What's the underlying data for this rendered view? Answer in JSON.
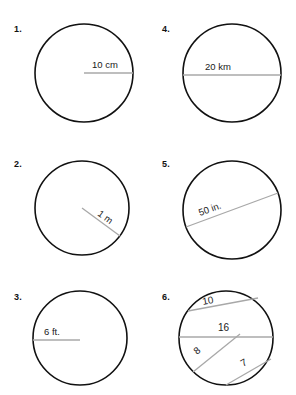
{
  "worksheet": {
    "title": "Circle radius and diameter worksheet",
    "problems": [
      {
        "number": "1.",
        "figure": "circle-with-radius",
        "label": "10 cm",
        "line_type": "radius",
        "direction": "center-to-right"
      },
      {
        "number": "2.",
        "figure": "circle-with-radius",
        "label": "1 m",
        "line_type": "radius",
        "direction": "center-to-lower-right"
      },
      {
        "number": "3.",
        "figure": "circle-with-radius",
        "label": "6 ft.",
        "line_type": "radius",
        "direction": "left-to-center"
      },
      {
        "number": "4.",
        "figure": "circle-with-diameter",
        "label": "20 km",
        "line_type": "diameter",
        "direction": "horizontal"
      },
      {
        "number": "5.",
        "figure": "circle-with-diameter",
        "label": "50 in.",
        "line_type": "diameter",
        "direction": "lower-left-to-upper-right"
      },
      {
        "number": "6.",
        "figure": "circle-with-chords",
        "line_type": "chords",
        "chord_labels": {
          "upper": "10",
          "middle": "16",
          "lower_left": "8",
          "lower_right": "7"
        }
      }
    ]
  },
  "colors": {
    "circle_stroke": "#111111",
    "measure_line": "#a8a8a8",
    "text": "#1a1a1a",
    "page_background": "#ffffff"
  }
}
